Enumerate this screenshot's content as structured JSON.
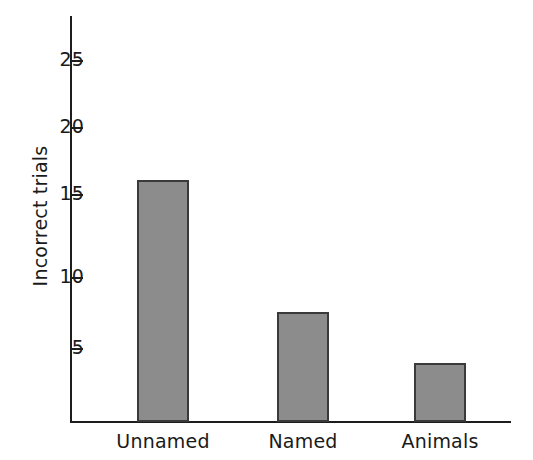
{
  "chart_data": {
    "type": "bar",
    "title": "",
    "xlabel": "",
    "ylabel": "Incorrect trials",
    "categories": [
      "Unnamed",
      "Named",
      "Animals"
    ],
    "values": [
      16.7,
      7.6,
      4.1
    ],
    "ylim": [
      0,
      27.5
    ],
    "yticks": [
      5,
      10,
      15,
      20,
      25
    ],
    "ytick_labels": [
      "5",
      "10",
      "15",
      "20",
      "25"
    ],
    "grid": false,
    "legend": null,
    "series": [
      {
        "name": "Incorrect trials",
        "values": [
          16.7,
          7.6,
          4.1
        ],
        "color": "#8c8c8c",
        "edge_color": "#3a3a3a"
      }
    ],
    "annotations": []
  },
  "axis": {
    "y_title": "Incorrect trials",
    "tick_25": "25",
    "tick_20": "20",
    "tick_15": "15",
    "tick_10": "10",
    "tick_5": "5"
  },
  "categories": {
    "c0": "Unnamed",
    "c1": "Named",
    "c2": "Animals"
  },
  "colors": {
    "bar_fill": "#8c8c8c",
    "bar_edge": "#3a3a3a",
    "axis": "#1d1d1d",
    "text": "#1a1a1a",
    "background": "#ffffff"
  }
}
